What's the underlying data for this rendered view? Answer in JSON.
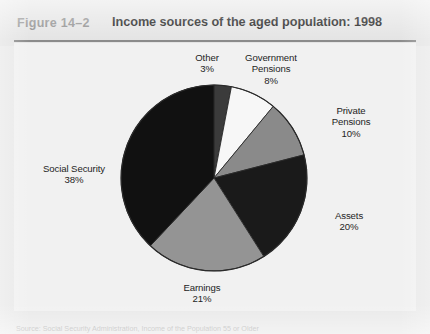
{
  "header": {
    "figure_number": "Figure 14–2",
    "title": "Income sources of the aged population: 1998"
  },
  "source_note": "Source: Social Security Administration, Income of the Population 55 or Older",
  "colors": {
    "page_background": "#e9e9e9",
    "header_band": "#e4e4e4",
    "panel_background": "#f1f1f1",
    "rule": "#8b8b8b",
    "figure_number_text": "#8e8e8e",
    "title_text": "#1b1b1b",
    "label_text": "#242424",
    "slice_outline": "#2a2a2a"
  },
  "chart_data": {
    "type": "pie",
    "title": "Income sources of the aged population: 1998",
    "subtitle": "",
    "xlabel": "",
    "ylabel": "",
    "units": "percent",
    "total": 100,
    "start_angle_deg": 0,
    "direction": "clockwise",
    "legend_position": "none",
    "labels_position": "outside",
    "grid": false,
    "categories": [
      "Other",
      "Government Pensions",
      "Private Pensions",
      "Assets",
      "Earnings",
      "Social Security"
    ],
    "values": [
      3,
      8,
      10,
      20,
      21,
      38
    ],
    "colors": [
      "#3b3b3b",
      "#f7f7f7",
      "#8a8a8a",
      "#1a1a1a",
      "#949494",
      "#111111"
    ],
    "slices": [
      {
        "label": "Other",
        "label_line1": "Other",
        "label_line2": "3%",
        "value": 3,
        "display_value": "3%",
        "color": "#3b3b3b"
      },
      {
        "label": "Government Pensions",
        "label_line1": "Government",
        "label_line15": "Pensions",
        "label_line2": "8%",
        "value": 8,
        "display_value": "8%",
        "color": "#f7f7f7"
      },
      {
        "label": "Private Pensions",
        "label_line1": "Private",
        "label_line15": "Pensions",
        "label_line2": "10%",
        "value": 10,
        "display_value": "10%",
        "color": "#8a8a8a"
      },
      {
        "label": "Assets",
        "label_line1": "Assets",
        "label_line2": "20%",
        "value": 20,
        "display_value": "20%",
        "color": "#1a1a1a"
      },
      {
        "label": "Earnings",
        "label_line1": "Earnings",
        "label_line2": "21%",
        "value": 21,
        "display_value": "21%",
        "color": "#949494"
      },
      {
        "label": "Social Security",
        "label_line1": "Social Security",
        "label_line2": "38%",
        "value": 38,
        "display_value": "38%",
        "color": "#111111"
      }
    ]
  }
}
